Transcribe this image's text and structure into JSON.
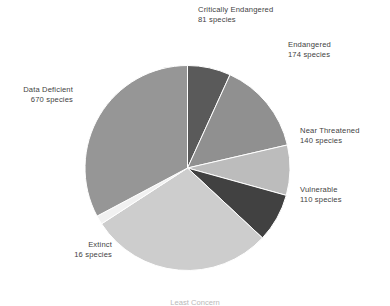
{
  "chart_data": {
    "type": "pie",
    "title": "",
    "subtitle": "",
    "xlabel": "",
    "ylabel": "",
    "unit": "species",
    "total": 1191,
    "legend_position": "callout-labels",
    "grid": false,
    "start_angle_deg": 0,
    "direction": "clockwise",
    "categories": [
      "Critically Endangered",
      "Endangered",
      "Near Threatened",
      "Vulnerable",
      "Least Concern",
      "Extinct",
      "Data Deficient"
    ],
    "values": [
      81,
      174,
      140,
      110,
      0,
      16,
      670
    ],
    "slices": [
      {
        "label": "Critically Endangered",
        "value": 81,
        "value_text": "81 species",
        "color": "#5a5a5a",
        "start_deg": 0,
        "end_deg": 24.5
      },
      {
        "label": "Endangered",
        "value": 174,
        "value_text": "174 species",
        "color": "#909090",
        "start_deg": 24.5,
        "end_deg": 77.0
      },
      {
        "label": "Near Threatened",
        "value": 140,
        "value_text": "140 species",
        "color": "#bcbcbc",
        "start_deg": 77.0,
        "end_deg": 105.5
      },
      {
        "label": "Vulnerable",
        "value": 110,
        "value_text": "110 species",
        "color": "#414141",
        "start_deg": 105.5,
        "end_deg": 133.0
      },
      {
        "label": "Least Concern",
        "value": 0,
        "value_text": "",
        "color": "#cdcdcd",
        "start_deg": 133.0,
        "end_deg": 237.0
      },
      {
        "label": "Extinct",
        "value": 16,
        "value_text": "16 species",
        "color": "#f1f1f1",
        "start_deg": 237.0,
        "end_deg": 242.0
      },
      {
        "label": "Data Deficient",
        "value": 670,
        "value_text": "670 species",
        "color": "#969696",
        "start_deg": 242.0,
        "end_deg": 360.0
      }
    ]
  },
  "labels": {
    "critically_endangered": {
      "category": "Critically Endangered",
      "value": "81 species"
    },
    "endangered": {
      "category": "Endangered",
      "value": "174 species"
    },
    "near_threatened": {
      "category": "Near Threatened",
      "value": "140 species"
    },
    "vulnerable": {
      "category": "Vulnerable",
      "value": "110 species"
    },
    "data_deficient": {
      "category": "Data Deficient",
      "value": "670 species"
    },
    "extinct": {
      "category": "Extinct",
      "value": "16 species"
    },
    "least_concern_clipped": {
      "text": "Least Concern"
    }
  },
  "colors": {
    "background": "#ffffff",
    "text": "#3f3f3f",
    "critically_endangered": "#5a5a5a",
    "endangered": "#909090",
    "near_threatened": "#bcbcbc",
    "vulnerable": "#414141",
    "least_concern": "#cdcdcd",
    "extinct": "#f1f1f1",
    "data_deficient": "#969696"
  }
}
